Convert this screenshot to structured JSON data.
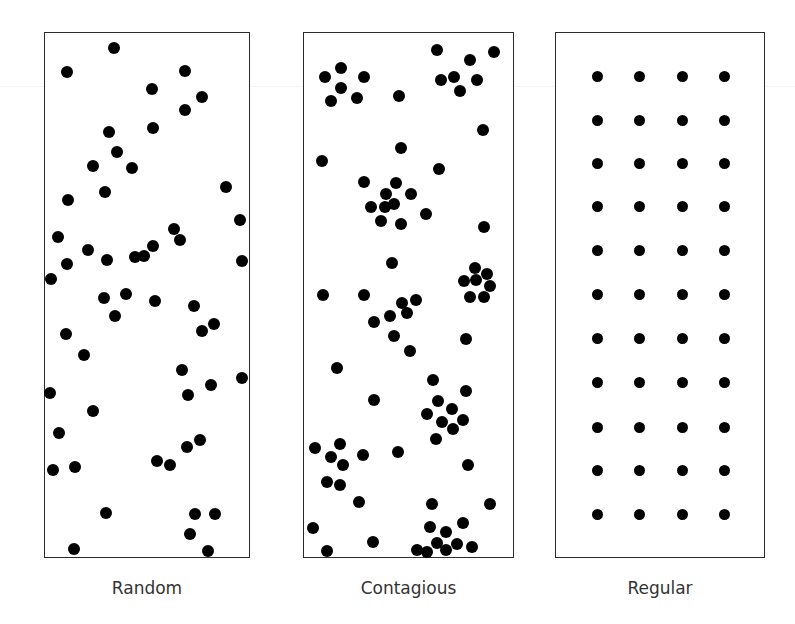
{
  "diagram": {
    "dot_color": "#000000",
    "panels": [
      {
        "id": "random",
        "label": "Random",
        "box": {
          "x": 44,
          "y": 32,
          "w": 206,
          "h": 526
        },
        "caption_y": 578,
        "dot_radius": 6,
        "dots": [
          [
            114,
            48
          ],
          [
            67,
            72
          ],
          [
            185,
            71
          ],
          [
            152,
            89
          ],
          [
            202,
            97
          ],
          [
            185,
            110
          ],
          [
            153,
            128
          ],
          [
            109,
            132
          ],
          [
            117,
            152
          ],
          [
            93,
            166
          ],
          [
            132,
            168
          ],
          [
            105,
            192
          ],
          [
            68,
            200
          ],
          [
            226,
            187
          ],
          [
            58,
            237
          ],
          [
            174,
            229
          ],
          [
            240,
            220
          ],
          [
            88,
            250
          ],
          [
            67,
            264
          ],
          [
            153,
            246
          ],
          [
            180,
            240
          ],
          [
            107,
            260
          ],
          [
            135,
            257
          ],
          [
            144,
            256
          ],
          [
            242,
            261
          ],
          [
            51,
            279
          ],
          [
            104,
            298
          ],
          [
            126,
            294
          ],
          [
            155,
            301
          ],
          [
            194,
            306
          ],
          [
            115,
            316
          ],
          [
            214,
            324
          ],
          [
            202,
            331
          ],
          [
            66,
            334
          ],
          [
            84,
            355
          ],
          [
            182,
            370
          ],
          [
            242,
            378
          ],
          [
            50,
            393
          ],
          [
            211,
            385
          ],
          [
            188,
            395
          ],
          [
            93,
            411
          ],
          [
            59,
            433
          ],
          [
            187,
            447
          ],
          [
            200,
            440
          ],
          [
            53,
            470
          ],
          [
            75,
            467
          ],
          [
            157,
            461
          ],
          [
            170,
            465
          ],
          [
            106,
            513
          ],
          [
            195,
            514
          ],
          [
            215,
            514
          ],
          [
            190,
            534
          ],
          [
            74,
            549
          ],
          [
            208,
            551
          ]
        ]
      },
      {
        "id": "contagious",
        "label": "Contagious",
        "box": {
          "x": 303,
          "y": 32,
          "w": 211,
          "h": 526
        },
        "caption_y": 578,
        "dot_radius": 6,
        "dots": [
          [
            437,
            50
          ],
          [
            494,
            52
          ],
          [
            470,
            60
          ],
          [
            341,
            68
          ],
          [
            325,
            77
          ],
          [
            364,
            77
          ],
          [
            441,
            80
          ],
          [
            454,
            77
          ],
          [
            477,
            80
          ],
          [
            341,
            88
          ],
          [
            460,
            91
          ],
          [
            331,
            101
          ],
          [
            357,
            98
          ],
          [
            399,
            96
          ],
          [
            483,
            130
          ],
          [
            401,
            148
          ],
          [
            322,
            161
          ],
          [
            439,
            169
          ],
          [
            364,
            182
          ],
          [
            396,
            183
          ],
          [
            386,
            194
          ],
          [
            411,
            194
          ],
          [
            371,
            207
          ],
          [
            385,
            207
          ],
          [
            394,
            204
          ],
          [
            426,
            214
          ],
          [
            381,
            221
          ],
          [
            401,
            224
          ],
          [
            484,
            227
          ],
          [
            392,
            263
          ],
          [
            475,
            268
          ],
          [
            487,
            274
          ],
          [
            464,
            281
          ],
          [
            476,
            280
          ],
          [
            490,
            286
          ],
          [
            470,
            297
          ],
          [
            484,
            297
          ],
          [
            323,
            295
          ],
          [
            364,
            295
          ],
          [
            416,
            300
          ],
          [
            407,
            313
          ],
          [
            402,
            303
          ],
          [
            374,
            322
          ],
          [
            390,
            316
          ],
          [
            394,
            336
          ],
          [
            410,
            351
          ],
          [
            466,
            339
          ],
          [
            337,
            368
          ],
          [
            433,
            380
          ],
          [
            466,
            391
          ],
          [
            374,
            400
          ],
          [
            427,
            414
          ],
          [
            438,
            401
          ],
          [
            452,
            409
          ],
          [
            463,
            420
          ],
          [
            442,
            422
          ],
          [
            453,
            429
          ],
          [
            436,
            439
          ],
          [
            315,
            448
          ],
          [
            340,
            444
          ],
          [
            331,
            457
          ],
          [
            343,
            465
          ],
          [
            363,
            455
          ],
          [
            327,
            482
          ],
          [
            340,
            485
          ],
          [
            398,
            452
          ],
          [
            468,
            465
          ],
          [
            359,
            502
          ],
          [
            432,
            504
          ],
          [
            490,
            504
          ],
          [
            313,
            528
          ],
          [
            430,
            527
          ],
          [
            463,
            523
          ],
          [
            446,
            532
          ],
          [
            437,
            543
          ],
          [
            457,
            544
          ],
          [
            472,
            547
          ],
          [
            417,
            550
          ],
          [
            427,
            552
          ],
          [
            446,
            550
          ],
          [
            327,
            551
          ],
          [
            373,
            542
          ]
        ]
      },
      {
        "id": "regular",
        "label": "Regular",
        "box": {
          "x": 555,
          "y": 32,
          "w": 210,
          "h": 526
        },
        "caption_y": 578,
        "dot_radius": 5.5,
        "grid": {
          "columns_x": [
            597,
            639,
            682,
            724
          ],
          "rows_y": [
            76,
            120,
            163,
            206,
            250,
            294,
            338,
            382,
            427,
            470,
            514
          ]
        }
      }
    ]
  }
}
